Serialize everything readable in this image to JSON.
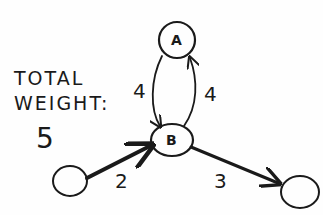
{
  "annotation": {
    "line1": "TOTAL",
    "line2": "WEIGHT:",
    "value": "5"
  },
  "nodes": [
    {
      "id": "A",
      "label": "A"
    },
    {
      "id": "B",
      "label": "B"
    },
    {
      "id": "source",
      "label": ""
    },
    {
      "id": "sink",
      "label": ""
    }
  ],
  "edges": [
    {
      "from": "A",
      "to": "B",
      "weight": "4"
    },
    {
      "from": "B",
      "to": "A",
      "weight": "4"
    },
    {
      "from": "source",
      "to": "B",
      "weight": "2"
    },
    {
      "from": "B",
      "to": "sink",
      "weight": "3"
    }
  ],
  "colors": {
    "ink": "#1a1a1a",
    "paper": "#fefefe"
  }
}
